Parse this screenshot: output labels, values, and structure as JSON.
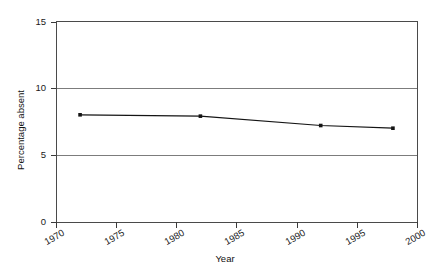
{
  "chart_data": {
    "type": "line",
    "title": "",
    "xlabel": "Year",
    "ylabel": "Percentage absent",
    "xlim": [
      1970,
      2000
    ],
    "ylim": [
      0,
      15
    ],
    "xticks": [
      1970,
      1975,
      1980,
      1985,
      1990,
      1995,
      2000
    ],
    "xtick_labels": [
      "1970",
      "1975",
      "1980",
      "1985",
      "1990",
      "1995",
      "2000"
    ],
    "yticks": [
      0,
      5,
      10,
      15
    ],
    "ytick_labels": [
      "0",
      "5",
      "10",
      "15"
    ],
    "grid": "horizontal",
    "legend": "none",
    "series": [
      {
        "name": "Percentage absent",
        "marker": "dot",
        "color": "#141414",
        "x": [
          1972,
          1982,
          1992,
          1998
        ],
        "values": [
          8.0,
          7.9,
          7.2,
          7.0
        ]
      }
    ]
  },
  "axis": {
    "x_title": "Year",
    "y_title": "Percentage absent"
  },
  "ticks": {
    "y": [
      "15",
      "10",
      "5",
      "0"
    ],
    "x": [
      "1970",
      "1975",
      "1980",
      "1985",
      "1990",
      "1995",
      "2000"
    ]
  },
  "colors": {
    "series": "#141414",
    "frame": "#4a4a4a",
    "grid": "#6e6e6e",
    "background": "#ffffff",
    "text": "#1a1a1a"
  }
}
